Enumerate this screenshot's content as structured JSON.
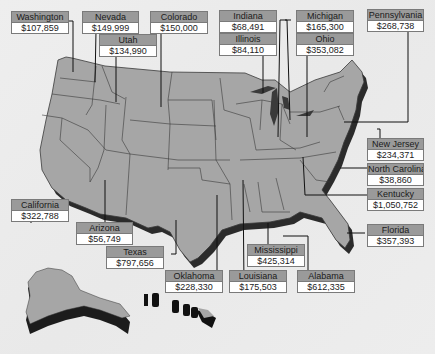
{
  "map": {
    "title": "",
    "type": "US state values map",
    "colors": {
      "state_fill": "#a6a6a6",
      "state_border": "#333333",
      "shadow": "#2a2a2a",
      "label_header": "#9a9a9a",
      "label_value_bg": "#ffffff",
      "background": "#ececec"
    },
    "labels": [
      {
        "state": "Washington",
        "value": "$107,859"
      },
      {
        "state": "Nevada",
        "value": "$149,999"
      },
      {
        "state": "Utah",
        "value": "$134,990"
      },
      {
        "state": "Colorado",
        "value": "$150,000"
      },
      {
        "state": "Indiana",
        "value": "$68,491"
      },
      {
        "state": "Illinois",
        "value": "$84,110"
      },
      {
        "state": "Michigan",
        "value": "$165,300"
      },
      {
        "state": "Ohio",
        "value": "$353,082"
      },
      {
        "state": "Pennsylvania",
        "value": "$268,738"
      },
      {
        "state": "New Jersey",
        "value": "$234,371"
      },
      {
        "state": "North Carolina",
        "value": "$38,860"
      },
      {
        "state": "Kentucky",
        "value": "$1,050,752"
      },
      {
        "state": "Florida",
        "value": "$357,393"
      },
      {
        "state": "California",
        "value": "$322,788"
      },
      {
        "state": "Arizona",
        "value": "$56,749"
      },
      {
        "state": "Texas",
        "value": "$797,656"
      },
      {
        "state": "Mississippi",
        "value": "$425,314"
      },
      {
        "state": "Oklahoma",
        "value": "$228,330"
      },
      {
        "state": "Louisiana",
        "value": "$175,503"
      },
      {
        "state": "Alabama",
        "value": "$612,335"
      }
    ]
  }
}
